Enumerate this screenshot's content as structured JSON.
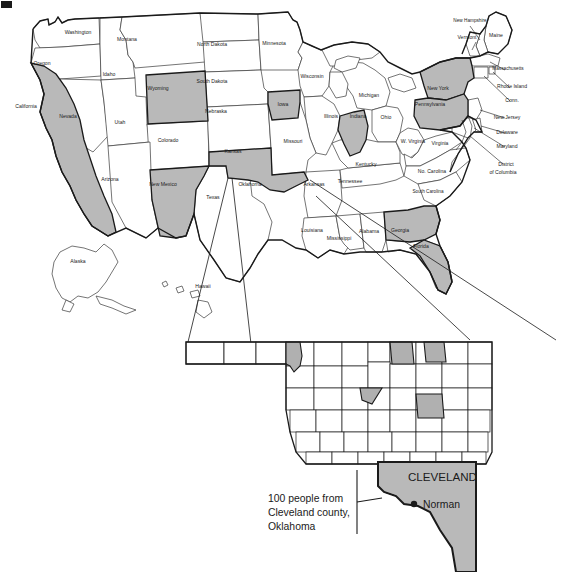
{
  "figure": {
    "mark": "figure-label-mark",
    "kind": "choropleth-map-with-inset"
  },
  "colors": {
    "shaded_state": "#b9b9b9",
    "shaded_county": "#b0b0b0",
    "unshaded": "#ffffff",
    "outline": "#1a1a1a",
    "thin_outline": "#3a3a3a",
    "text": "#1a1a1a"
  },
  "main_map": {
    "name": "united-states-map",
    "state_labels": [
      {
        "name": "Washington",
        "x": 78,
        "y": 34,
        "shaded": false
      },
      {
        "name": "Oregon",
        "x": 42,
        "y": 65,
        "shaded": false
      },
      {
        "name": "Idaho",
        "x": 109,
        "y": 76,
        "shaded": false
      },
      {
        "name": "Montana",
        "x": 127,
        "y": 41,
        "shaded": false
      },
      {
        "name": "Wyoming",
        "x": 158,
        "y": 90,
        "shaded": true
      },
      {
        "name": "North Dakota",
        "x": 212,
        "y": 46,
        "shaded": false
      },
      {
        "name": "South Dakota",
        "x": 212,
        "y": 83,
        "shaded": false
      },
      {
        "name": "Nebraska",
        "x": 216,
        "y": 113,
        "shaded": false
      },
      {
        "name": "Minnesota",
        "x": 274,
        "y": 45,
        "shaded": false
      },
      {
        "name": "Iowa",
        "x": 283,
        "y": 106,
        "shaded": true
      },
      {
        "name": "Wisconsin",
        "x": 312,
        "y": 78,
        "shaded": false
      },
      {
        "name": "Michigan",
        "x": 369,
        "y": 97,
        "shaded": false
      },
      {
        "name": "Illinois",
        "x": 331,
        "y": 118,
        "shaded": false
      },
      {
        "name": "Indiana",
        "x": 358,
        "y": 118,
        "shaded": true
      },
      {
        "name": "Ohio",
        "x": 386,
        "y": 119,
        "shaded": false
      },
      {
        "name": "California",
        "x": 26,
        "y": 108,
        "shaded": true
      },
      {
        "name": "Nevada",
        "x": 68,
        "y": 118,
        "shaded": false
      },
      {
        "name": "Utah",
        "x": 120,
        "y": 124,
        "shaded": false
      },
      {
        "name": "Colorado",
        "x": 168,
        "y": 142,
        "shaded": false
      },
      {
        "name": "Kansas",
        "x": 233,
        "y": 153,
        "shaded": false
      },
      {
        "name": "Missouri",
        "x": 293,
        "y": 143,
        "shaded": false
      },
      {
        "name": "Arizona",
        "x": 110,
        "y": 181,
        "shaded": false
      },
      {
        "name": "New Mexico",
        "x": 163,
        "y": 186,
        "shaded": true
      },
      {
        "name": "Texas",
        "x": 213,
        "y": 199,
        "shaded": false
      },
      {
        "name": "Oklahoma",
        "x": 250,
        "y": 186,
        "shaded": true
      },
      {
        "name": "Arkansas",
        "x": 314,
        "y": 186,
        "shaded": false
      },
      {
        "name": "Louisiana",
        "x": 312,
        "y": 232,
        "shaded": false
      },
      {
        "name": "Mississippi",
        "x": 339,
        "y": 240,
        "shaded": false
      },
      {
        "name": "Alabama",
        "x": 369,
        "y": 233,
        "shaded": false
      },
      {
        "name": "Tennessee",
        "x": 350,
        "y": 183,
        "shaded": false
      },
      {
        "name": "Kentucky",
        "x": 366,
        "y": 166,
        "shaded": false
      },
      {
        "name": "Georgia",
        "x": 400,
        "y": 232,
        "shaded": true
      },
      {
        "name": "Florida",
        "x": 421,
        "y": 248,
        "shaded": true
      },
      {
        "name": "South Carolina",
        "x": 428,
        "y": 193,
        "shaded": false
      },
      {
        "name": "No. Carolina",
        "x": 432,
        "y": 173,
        "shaded": false
      },
      {
        "name": "Virginia",
        "x": 440,
        "y": 145,
        "shaded": false
      },
      {
        "name": "W. Virginia",
        "x": 413,
        "y": 143,
        "shaded": false
      },
      {
        "name": "Pennsylvania",
        "x": 430,
        "y": 106,
        "shaded": true
      },
      {
        "name": "New York",
        "x": 438,
        "y": 90,
        "shaded": true
      },
      {
        "name": "Vermont",
        "x": 467,
        "y": 39,
        "shaded": false
      },
      {
        "name": "New Hampshire",
        "x": 470,
        "y": 22,
        "shaded": false
      },
      {
        "name": "Maine",
        "x": 496,
        "y": 37,
        "shaded": false
      },
      {
        "name": "Massachusetts",
        "x": 508,
        "y": 70,
        "shaded": false
      },
      {
        "name": "Rhode Island",
        "x": 512,
        "y": 88,
        "shaded": false
      },
      {
        "name": "Conn.",
        "x": 512,
        "y": 102,
        "shaded": false
      },
      {
        "name": "New Jersey",
        "x": 507,
        "y": 119,
        "shaded": false
      },
      {
        "name": "Delaware",
        "x": 507,
        "y": 134,
        "shaded": false
      },
      {
        "name": "Maryland",
        "x": 507,
        "y": 148,
        "shaded": false
      },
      {
        "name": "District",
        "x": 506,
        "y": 166,
        "shaded": false
      },
      {
        "name": "of Columbia",
        "x": 503,
        "y": 174,
        "shaded": false
      },
      {
        "name": "Alaska",
        "x": 78,
        "y": 263,
        "shaded": false
      },
      {
        "name": "Hawaii",
        "x": 203,
        "y": 288,
        "shaded": false
      }
    ],
    "shaded_states": [
      "California",
      "Wyoming",
      "New Mexico",
      "Oklahoma",
      "Iowa",
      "Indiana",
      "Georgia",
      "Florida",
      "New York",
      "Pennsylvania"
    ]
  },
  "inset_map": {
    "name": "oklahoma-counties-inset",
    "title": "Oklahoma counties",
    "shaded_counties_count": 5
  },
  "callout": {
    "name": "cleveland-county-callout",
    "line1": "100 people from",
    "line2": "Cleveland county,",
    "line3": "Oklahoma",
    "county_label": "CLEVELAND",
    "city_label": "Norman",
    "city_marker": "filled-dot"
  }
}
